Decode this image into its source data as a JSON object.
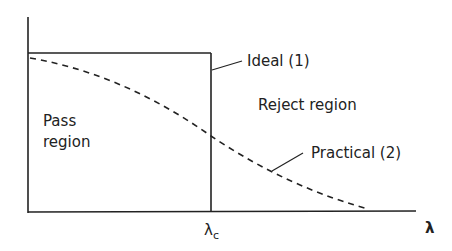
{
  "diagram": {
    "title": "",
    "axes": {
      "x_label": "λ",
      "y_label": ""
    },
    "cutoff_label_main": "λ",
    "cutoff_label_sub": "c",
    "labels": {
      "ideal": "Ideal (1)",
      "practical": "Practical (2)",
      "reject": "Reject region",
      "pass_line1": "Pass",
      "pass_line2": "region"
    },
    "colors": {
      "line": "#222222",
      "background": "#ffffff"
    }
  }
}
